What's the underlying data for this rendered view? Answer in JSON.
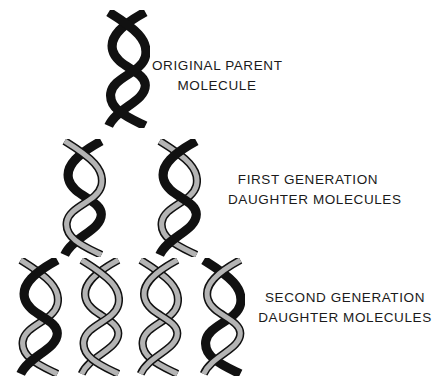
{
  "diagram": {
    "colors": {
      "old_strand": "#111111",
      "new_strand": "#b4b4b4",
      "outline": "#111111",
      "background": "#ffffff"
    },
    "generations": [
      {
        "id": "parent",
        "label_line1": "ORIGINAL PARENT",
        "label_line2": "MOLECULE",
        "molecules": [
          {
            "strands": [
              "old",
              "old"
            ]
          }
        ]
      },
      {
        "id": "first",
        "label_line1": "FIRST GENERATION",
        "label_line2": "DAUGHTER MOLECULES",
        "molecules": [
          {
            "strands": [
              "old",
              "new"
            ]
          },
          {
            "strands": [
              "new",
              "old"
            ]
          }
        ]
      },
      {
        "id": "second",
        "label_line1": "SECOND GENERATION",
        "label_line2": "DAUGHTER MOLECULES",
        "molecules": [
          {
            "strands": [
              "old",
              "new"
            ]
          },
          {
            "strands": [
              "new",
              "new"
            ]
          },
          {
            "strands": [
              "new",
              "new"
            ]
          },
          {
            "strands": [
              "new",
              "old"
            ]
          }
        ]
      }
    ]
  }
}
